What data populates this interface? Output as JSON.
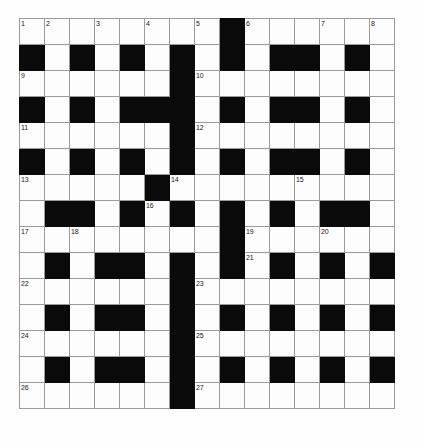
{
  "puzzle": {
    "title": "Crossword Grid",
    "rows": 15,
    "columns": 15,
    "cell_size_px": 26,
    "colors": {
      "block": "#0a0a0a",
      "open": "#fdfdfd",
      "gridline": "#9a9a9a",
      "border": "#8a8a8a",
      "number_text": "#1a1a1a"
    },
    "grid": [
      [
        "1",
        "2",
        "",
        "3",
        "",
        "4",
        "",
        "5",
        "#",
        "6",
        "",
        "",
        "7",
        "",
        "8"
      ],
      [
        "#",
        "",
        "#",
        "",
        "#",
        "",
        "#",
        "",
        "#",
        "",
        "#",
        "#",
        "",
        "#",
        ""
      ],
      [
        "9",
        "",
        "",
        "",
        "",
        "",
        "#",
        "10",
        "",
        "",
        "",
        "",
        "",
        "",
        ""
      ],
      [
        "#",
        "",
        "#",
        "",
        "#",
        "#",
        "#",
        "",
        "#",
        "",
        "#",
        "#",
        "",
        "#",
        ""
      ],
      [
        "11",
        "",
        "",
        "",
        "",
        "",
        "#",
        "12",
        "",
        "",
        "",
        "",
        "",
        "",
        ""
      ],
      [
        "#",
        "",
        "#",
        "",
        "#",
        "",
        "#",
        "",
        "#",
        "",
        "#",
        "#",
        "",
        "#",
        ""
      ],
      [
        "13",
        "",
        "",
        "",
        "",
        "#",
        "14",
        "",
        "",
        "",
        "",
        "15",
        "",
        "",
        ""
      ],
      [
        "",
        "#",
        "#",
        "",
        "#",
        "16",
        "#",
        "",
        "#",
        "",
        "#",
        "",
        "#",
        "#",
        ""
      ],
      [
        "17",
        "",
        "18",
        "",
        "",
        "",
        "",
        "",
        "#",
        "19",
        "",
        "",
        "20",
        "",
        ""
      ],
      [
        "",
        "#",
        "",
        "#",
        "#",
        "",
        "#",
        "",
        "#",
        "21",
        "#",
        "",
        "#",
        "",
        "#"
      ],
      [
        "22",
        "",
        "",
        "",
        "",
        "",
        "#",
        "23",
        "",
        "",
        "",
        "",
        "",
        "",
        ""
      ],
      [
        "",
        "#",
        "",
        "#",
        "#",
        "",
        "#",
        "",
        "#",
        "",
        "#",
        "",
        "#",
        "",
        "#"
      ],
      [
        "24",
        "",
        "",
        "",
        "",
        "",
        "#",
        "25",
        "",
        "",
        "",
        "",
        "",
        "",
        ""
      ],
      [
        "",
        "#",
        "",
        "#",
        "#",
        "",
        "#",
        "",
        "#",
        "",
        "#",
        "",
        "#",
        "",
        "#"
      ],
      [
        "26",
        "",
        "",
        "",
        "",
        "",
        "#",
        "27",
        "",
        "",
        "",
        "",
        "",
        "",
        ""
      ]
    ],
    "numbered_clues": [
      "1",
      "2",
      "3",
      "4",
      "5",
      "6",
      "7",
      "8",
      "9",
      "10",
      "11",
      "12",
      "13",
      "14",
      "15",
      "16",
      "17",
      "18",
      "19",
      "20",
      "21",
      "22",
      "23",
      "24",
      "25",
      "26",
      "27"
    ]
  }
}
